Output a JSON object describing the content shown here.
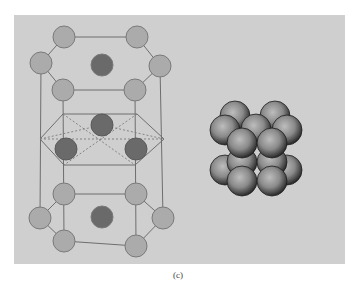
{
  "figure": {
    "caption": "(c)",
    "panel_color": "#cfcfcf",
    "colors": {
      "light_atom": "#ababab",
      "dark_atom": "#6a6a6a",
      "atom_stroke": "#7a7a7a",
      "bond": "#6e6e6e",
      "dashed": "#7c7c7c",
      "sphere_light": "#b5b5b5",
      "sphere_dark": "#2e2e2e"
    },
    "left_model": {
      "label": "hcp-unit-cell-ball-and-stick",
      "top_layer": {
        "light_atoms": [
          [
            64,
            37
          ],
          [
            137,
            37
          ],
          [
            41,
            63
          ],
          [
            160,
            66
          ],
          [
            63,
            90
          ],
          [
            135,
            90
          ]
        ],
        "dark_atoms": [
          [
            102,
            65
          ]
        ]
      },
      "middle_layer": {
        "dark_atoms": [
          [
            102,
            125
          ],
          [
            66,
            149
          ],
          [
            136,
            149
          ]
        ]
      },
      "bottom_layer": {
        "light_atoms": [
          [
            64,
            194
          ],
          [
            136,
            194
          ],
          [
            40,
            218
          ],
          [
            163,
            218
          ],
          [
            64,
            241
          ],
          [
            136,
            246
          ]
        ],
        "dark_atoms": [
          [
            102,
            217
          ]
        ]
      },
      "atom_radius": 11
    },
    "right_model": {
      "label": "hcp-space-filling-model",
      "sphere_radius": 15
    }
  }
}
